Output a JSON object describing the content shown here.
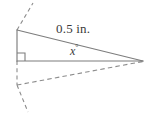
{
  "figure": {
    "type": "geometry-diagram",
    "stroke_color": "#808080",
    "dash_color": "#8c8c8c",
    "text_color": "#3a3a3a",
    "background_color": "#ffffff",
    "labels": {
      "hypotenuse_length": "0.5 in.",
      "angle": "x",
      "angle_degree_symbol": "°"
    },
    "vertices": {
      "top_left": [
        17,
        30
      ],
      "bottom_left": [
        17,
        61
      ],
      "apex_right": [
        143,
        61
      ]
    },
    "solid_segments": [
      {
        "name": "hypotenuse",
        "from": [
          17,
          30
        ],
        "to": [
          143,
          61
        ]
      },
      {
        "name": "vertical-leg",
        "from": [
          17,
          30
        ],
        "to": [
          17,
          61
        ]
      },
      {
        "name": "horizontal-base",
        "from": [
          17,
          61
        ],
        "to": [
          143,
          61
        ]
      }
    ],
    "dashed_segments": [
      {
        "name": "upper-extension-ray",
        "from": [
          17,
          30
        ],
        "to": [
          33,
          3
        ]
      },
      {
        "name": "lower-vertical-dashed",
        "from": [
          17,
          61
        ],
        "to": [
          17,
          85
        ]
      },
      {
        "name": "lower-ray-to-apex",
        "from": [
          17,
          85
        ],
        "to": [
          143,
          61
        ]
      },
      {
        "name": "lower-extension-ray",
        "from": [
          17,
          85
        ],
        "to": [
          28,
          112
        ]
      }
    ],
    "right_angle_marker": {
      "name": "right-angle-square",
      "corner": [
        17,
        61
      ],
      "size": 8
    }
  }
}
